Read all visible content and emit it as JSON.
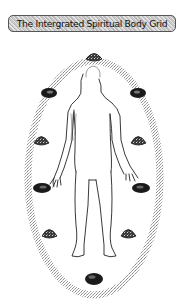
{
  "title": "The Intergrated Spiritual Body Grid",
  "colors": {
    "background": "#ffffff",
    "banner_fill": "#cfcfcf",
    "banner_border": "#555555",
    "grid_band": "#9a9a9a",
    "stone_dark": "#1a1a1a",
    "stone_light": "#6e6e6e",
    "body_outline": "#222222"
  },
  "grid": {
    "shape": "oval",
    "stone_count": 11,
    "stones": [
      {
        "position": "top",
        "type": "pyramid"
      },
      {
        "position": "upper-left",
        "type": "tumbled"
      },
      {
        "position": "upper-right",
        "type": "tumbled"
      },
      {
        "position": "mid-upper-left",
        "type": "pyramid"
      },
      {
        "position": "mid-upper-right",
        "type": "pyramid"
      },
      {
        "position": "mid-lower-left",
        "type": "tumbled"
      },
      {
        "position": "mid-lower-right",
        "type": "tumbled"
      },
      {
        "position": "lower-left",
        "type": "pyramid"
      },
      {
        "position": "lower-right",
        "type": "pyramid"
      },
      {
        "position": "bottom",
        "type": "tumbled"
      }
    ]
  }
}
